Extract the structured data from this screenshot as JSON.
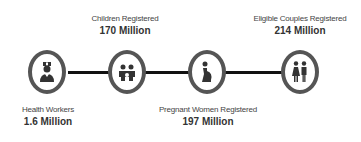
{
  "colors": {
    "line": "#111111",
    "circle_border": "#555555",
    "icon": "#333333",
    "text": "#444444"
  },
  "stats": [
    {
      "id": "health-workers",
      "icon": "nurse-icon",
      "label": "Health Workers",
      "value": "1.6 Million",
      "position": "below"
    },
    {
      "id": "children",
      "icon": "children-icon",
      "label": "Children Registered",
      "value": "170 Million",
      "position": "above"
    },
    {
      "id": "pregnant-women",
      "icon": "pregnant-woman-icon",
      "label": "Pregnant Women Registered",
      "value": "197 Million",
      "position": "below"
    },
    {
      "id": "eligible-couples",
      "icon": "couple-icon",
      "label": "Eligible Couples Registered",
      "value": "214 Million",
      "position": "above"
    }
  ]
}
